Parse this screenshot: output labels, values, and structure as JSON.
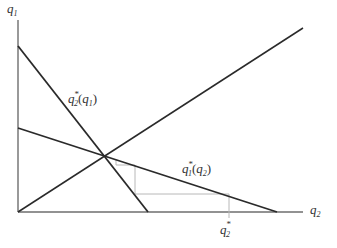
{
  "diagram": {
    "axes": {
      "y_label": {
        "base": "q",
        "sub": "1"
      },
      "x_label": {
        "base": "q",
        "sub": "2"
      }
    },
    "curves": [
      {
        "id": "br2",
        "label": {
          "base": "q",
          "sup": "*",
          "sub": "2",
          "arg_base": "q",
          "arg_sub": "1",
          "open": "(",
          "close": ")"
        }
      },
      {
        "id": "br1",
        "label": {
          "base": "q",
          "sup": "*",
          "sub": "1",
          "arg_base": "q",
          "arg_sub": "2",
          "open": "(",
          "close": ")"
        }
      },
      {
        "id": "ray",
        "label": null
      }
    ],
    "tick": {
      "base": "q",
      "sup": "*",
      "sub": "2"
    },
    "colors": {
      "axis": "#6e6e6e",
      "curve": "#2a2a2a",
      "step": "#b8b8b8",
      "text": "#333333"
    }
  }
}
